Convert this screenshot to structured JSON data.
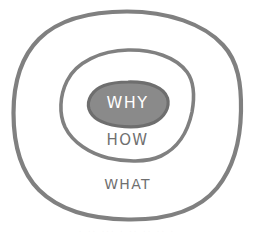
{
  "diagram": {
    "type": "concentric-circles",
    "background_color": "#ffffff",
    "stroke_color": "#808080",
    "inner_fill_color": "#8a8a8a",
    "inner_stroke_color": "#6e6e6e",
    "label_color": "#6f6f6f",
    "inner_label_color": "#ffffff",
    "rings": [
      {
        "id": "outer",
        "label": "WHAT",
        "level": 3,
        "fill": "#ffffff",
        "stroke": "#808080",
        "stroke_width": 4.2,
        "cx": 127,
        "cy": 115,
        "rx": 112,
        "ry": 103
      },
      {
        "id": "middle",
        "label": "HOW",
        "level": 2,
        "fill": "#ffffff",
        "stroke": "#808080",
        "stroke_width": 3.6,
        "cx": 127,
        "cy": 105,
        "rx": 66,
        "ry": 54
      },
      {
        "id": "inner",
        "label": "WHY",
        "level": 1,
        "fill": "#8a8a8a",
        "stroke": "#6e6e6e",
        "stroke_width": 3.2,
        "cx": 128,
        "cy": 104,
        "rx": 40,
        "ry": 23
      }
    ]
  },
  "artifacts": {
    "bottom_marks": "·  ·· ···   ·  ··  ··   ·· ·"
  }
}
